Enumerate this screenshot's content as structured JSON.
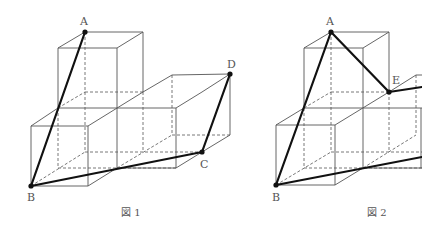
{
  "figures": [
    {
      "caption": "図 1",
      "points": {
        "A": {
          "label": "A",
          "x": 85,
          "y": 32
        },
        "B": {
          "label": "B",
          "x": 31,
          "y": 186
        },
        "C": {
          "label": "C",
          "x": 202,
          "y": 152
        },
        "D": {
          "label": "D",
          "x": 230,
          "y": 74
        }
      },
      "bold_segments": [
        "A-B",
        "B-C",
        "C-D"
      ]
    },
    {
      "caption": "図 2",
      "points": {
        "A": {
          "label": "A",
          "x": 331,
          "y": 32
        },
        "B": {
          "label": "B",
          "x": 276,
          "y": 185
        },
        "E": {
          "label": "E",
          "x": 389,
          "y": 92
        }
      },
      "bold_segments": [
        "A-B",
        "A-E",
        "E-right",
        "B-right"
      ]
    }
  ],
  "colors": {
    "line": "#555555",
    "bold": "#111111",
    "background": "#ffffff"
  }
}
